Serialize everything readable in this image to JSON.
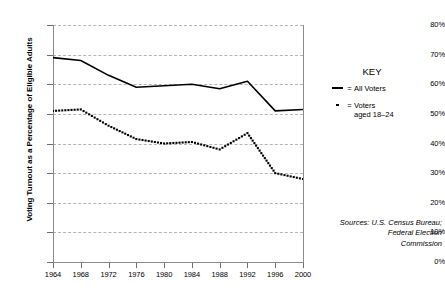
{
  "chart_data": {
    "type": "line",
    "title": "",
    "xlabel": "",
    "ylabel": "Voting Turnout as a Percentage of Eligible Adults",
    "x": [
      1964,
      1968,
      1972,
      1976,
      1980,
      1984,
      1988,
      1992,
      1996,
      2000
    ],
    "categories": [
      "1964",
      "1968",
      "1972",
      "1976",
      "1980",
      "1984",
      "1988",
      "1992",
      "1996",
      "2000"
    ],
    "xlim": [
      1964,
      2000
    ],
    "ylim": [
      0,
      80
    ],
    "ytick_values": [
      0,
      10,
      20,
      30,
      40,
      50,
      60,
      70,
      80
    ],
    "ytick_labels": [
      "0%",
      "10%",
      "20%",
      "30%",
      "40%",
      "50%",
      "60%",
      "70%",
      "80%"
    ],
    "grid": true,
    "legend_position": "right",
    "series": [
      {
        "name": "All Voters",
        "style": "solid",
        "color": "#000000",
        "values": [
          69,
          68,
          63,
          59,
          59.5,
          60,
          58.5,
          61,
          51,
          51.5
        ]
      },
      {
        "name": "Voters aged 18–24",
        "style": "dotted",
        "color": "#000000",
        "values": [
          51,
          51.5,
          46,
          41.5,
          40,
          40.5,
          38,
          43.5,
          30,
          28
        ]
      }
    ]
  },
  "legend": {
    "title": "KEY",
    "equals": "=",
    "entries": [
      {
        "marker": "line",
        "label": "All Voters"
      },
      {
        "marker": "dot",
        "label": "Voters\naged 18–24"
      }
    ]
  },
  "sources": {
    "line1": "Sources: U.S. Census Bureau;",
    "line2": "Federal Election",
    "line3": "Commission"
  }
}
